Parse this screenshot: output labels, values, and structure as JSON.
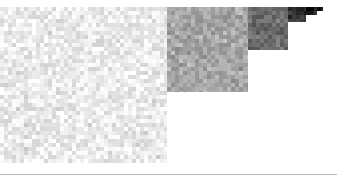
{
  "figure": {
    "title": "",
    "background_color": "#ffffff",
    "width": 337,
    "height": 185
  },
  "divider": {
    "name": "horizontal-rule",
    "color": "#b9b9b9",
    "y": 174,
    "thickness": 1,
    "x_start": 0,
    "x_end": 337
  },
  "chart_data": {
    "type": "heatmap",
    "title": "",
    "subtitle": "",
    "xlabel": "",
    "ylabel": "",
    "legend": [],
    "grid": false,
    "cell_size": 4,
    "noise_amplitude": 22,
    "x_range": [
      0,
      337
    ],
    "y_range": [
      7,
      163
    ],
    "blocks": [
      {
        "name": "block-1",
        "label": "lightest",
        "x": 0,
        "y": 7,
        "width": 167,
        "height": 156,
        "mean_gray": 233,
        "color": "#e9e9e9"
      },
      {
        "name": "block-2",
        "label": "light-mid",
        "x": 167,
        "y": 7,
        "width": 81,
        "height": 85,
        "mean_gray": 163,
        "color": "#a3a3a3"
      },
      {
        "name": "block-3",
        "label": "mid-dark",
        "x": 248,
        "y": 7,
        "width": 40,
        "height": 43,
        "mean_gray": 104,
        "color": "#686868"
      },
      {
        "name": "block-4",
        "label": "dark",
        "x": 288,
        "y": 7,
        "width": 18,
        "height": 15,
        "mean_gray": 48,
        "color": "#303030"
      },
      {
        "name": "block-5",
        "label": "darkest",
        "x": 306,
        "y": 7,
        "width": 11,
        "height": 8,
        "mean_gray": 20,
        "color": "#141414"
      },
      {
        "name": "block-6",
        "label": "tip",
        "x": 317,
        "y": 7,
        "width": 6,
        "height": 4,
        "mean_gray": 12,
        "color": "#0c0c0c"
      }
    ]
  }
}
